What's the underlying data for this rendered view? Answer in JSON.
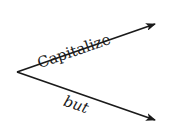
{
  "diagram": {
    "type": "branching-arrows",
    "vertex": {
      "x": 17,
      "y": 72
    },
    "branches": [
      {
        "label": "Capitalize",
        "label_style": "upright",
        "end": {
          "x": 155,
          "y": 24
        }
      },
      {
        "label": "but",
        "label_style": "italic",
        "end": {
          "x": 155,
          "y": 120
        }
      }
    ],
    "colors": {
      "stroke": "#1a1a1a",
      "background": "#ffffff"
    }
  }
}
